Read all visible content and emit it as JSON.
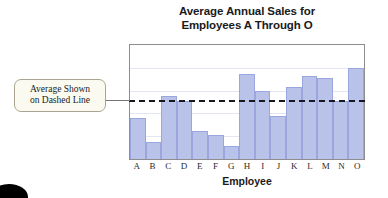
{
  "chart_data": {
    "type": "bar",
    "title": "Average Annual Sales for Employees A Through O",
    "title_line1": "Average Annual Sales for",
    "title_line2": "Employees A Through O",
    "xlabel": "Employee",
    "ylabel": "",
    "categories": [
      "A",
      "B",
      "C",
      "D",
      "E",
      "F",
      "G",
      "H",
      "I",
      "J",
      "K",
      "L",
      "M",
      "N",
      "O"
    ],
    "values": [
      36,
      15,
      55,
      51,
      25,
      21,
      11,
      75,
      60,
      38,
      63,
      73,
      71,
      51,
      80
    ],
    "ylim": [
      0,
      100
    ],
    "grid": true,
    "gridline_values": [
      20,
      40,
      60,
      80
    ],
    "legend": "none",
    "bar_color": "#b9c2e8",
    "bar_border_color": "#9aa6dd",
    "reference_line": {
      "label": "Average",
      "value": 51,
      "style": "dashed",
      "color": "#17171f"
    }
  },
  "annotation": {
    "line1": "Average Shown",
    "line2": "on Dashed Line",
    "text": "Average Shown on Dashed Line"
  }
}
